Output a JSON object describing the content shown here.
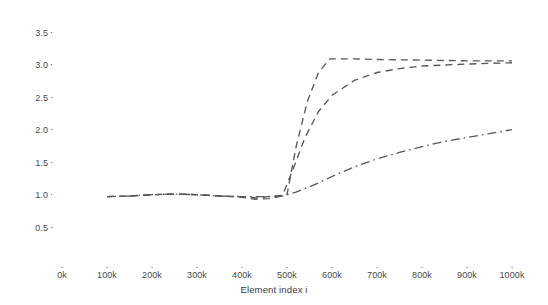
{
  "chart_data": {
    "type": "line",
    "title": "",
    "xlabel": "Element index i",
    "ylabel": "",
    "xlim": [
      0,
      1000000
    ],
    "ylim": [
      0.4,
      3.62
    ],
    "grid": false,
    "legend": "none",
    "x_tick_labels": [
      "0k",
      "100k",
      "200k",
      "300k",
      "400k",
      "500k",
      "600k",
      "700k",
      "800k",
      "900k",
      "1000k"
    ],
    "x_tick_values": [
      0,
      100000,
      200000,
      300000,
      400000,
      500000,
      600000,
      700000,
      800000,
      900000,
      1000000
    ],
    "y_tick_labels": [
      "0.5",
      "1.0",
      "1.5",
      "2.0",
      "2.5",
      "3.0",
      "3.5"
    ],
    "y_tick_values": [
      0.5,
      1.0,
      1.5,
      2.0,
      2.5,
      3.0,
      3.5
    ],
    "series": [
      {
        "name": "series-1",
        "style": "dashed",
        "color": "#58585c",
        "x": [
          100000,
          150000,
          200000,
          250000,
          300000,
          350000,
          400000,
          430000,
          460000,
          490000,
          500000,
          520000,
          545000,
          570000,
          595000,
          650000,
          700000,
          800000,
          900000,
          1000000
        ],
        "values": [
          0.99,
          1.0,
          1.02,
          1.03,
          1.02,
          1.0,
          0.98,
          0.95,
          0.96,
          1.0,
          1.02,
          1.75,
          2.45,
          2.9,
          3.11,
          3.11,
          3.1,
          3.09,
          3.08,
          3.08
        ]
      },
      {
        "name": "series-2",
        "style": "dashed",
        "color": "#58585c",
        "x": [
          100000,
          150000,
          200000,
          250000,
          300000,
          350000,
          400000,
          430000,
          460000,
          490000,
          510000,
          540000,
          570000,
          600000,
          650000,
          700000,
          750000,
          800000,
          900000,
          1000000
        ],
        "values": [
          0.99,
          1.0,
          1.02,
          1.03,
          1.02,
          1.0,
          0.99,
          0.97,
          0.99,
          1.01,
          1.35,
          1.9,
          2.3,
          2.55,
          2.78,
          2.9,
          2.96,
          3.0,
          3.03,
          3.05
        ]
      },
      {
        "name": "series-3",
        "style": "dash-dot",
        "color": "#58585c",
        "x": [
          100000,
          150000,
          200000,
          250000,
          300000,
          350000,
          400000,
          450000,
          490000,
          520000,
          560000,
          600000,
          650000,
          700000,
          750000,
          800000,
          850000,
          900000,
          950000,
          1000000
        ],
        "values": [
          0.99,
          1.0,
          1.02,
          1.03,
          1.02,
          1.0,
          0.99,
          0.99,
          1.0,
          1.06,
          1.17,
          1.3,
          1.45,
          1.57,
          1.67,
          1.76,
          1.84,
          1.9,
          1.96,
          2.02
        ]
      }
    ]
  }
}
